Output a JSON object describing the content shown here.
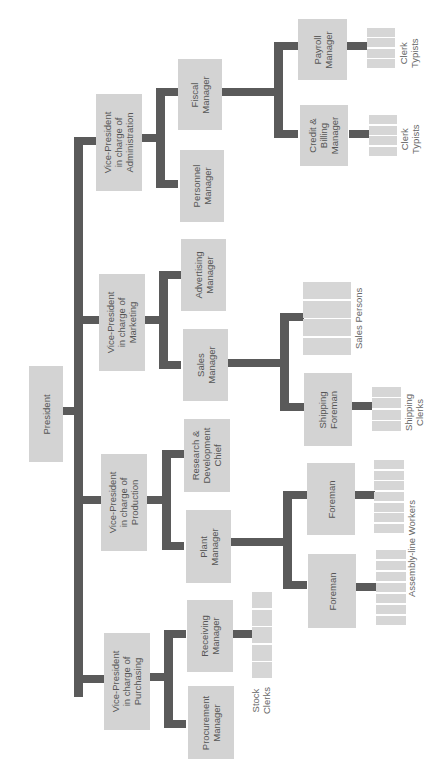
{
  "chart": {
    "orientation": "rotated 90 degrees clockwise (root on left)",
    "colors": {
      "box_fill": "#d3d3d3",
      "connector": "#5a5a5a",
      "text": "#555555",
      "background": "#ffffff"
    }
  },
  "nodes": {
    "president": "President",
    "vp_admin": "Vice-President\nin charge of\nAdministration",
    "vp_marketing": "Vice-President\nin charge of\nMarketing",
    "vp_production": "Vice-President\nin charge of\nProduction",
    "vp_purchasing": "Vice-President\nin charge of\nPurchasing",
    "fiscal_manager": "Fiscal\nManager",
    "personnel_manager": "Personnel\nManager",
    "advertising_manager": "Advertising\nManager",
    "sales_manager": "Sales\nManager",
    "rd_chief": "Research &\nDevelopment\nChief",
    "plant_manager": "Plant\nManager",
    "receiving_manager": "Receiving\nManager",
    "procurement_manager": "Procurement\nManager",
    "payroll_manager": "Payroll\nManager",
    "credit_billing_manager": "Credit &\nBilling\nManager",
    "shipping_foreman": "Shipping\nForeman",
    "foreman_1": "Foreman",
    "foreman_2": "Foreman"
  },
  "groups": {
    "clerk_typists_payroll": "Clerk\nTypists",
    "clerk_typists_credit": "Clerk\nTypists",
    "sales_persons": "Sales Persons",
    "shipping_clerks": "Shipping\nClerks",
    "assembly_line_workers": "Assembly-line Workers",
    "stock_clerks": "Stock\nClerks"
  },
  "hierarchy": [
    {
      "name": "President",
      "children": [
        {
          "name": "Vice-President in charge of Administration",
          "children": [
            {
              "name": "Fiscal Manager",
              "children": [
                {
                  "name": "Payroll Manager",
                  "children": [
                    {
                      "name": "Clerk Typists"
                    }
                  ]
                },
                {
                  "name": "Credit & Billing Manager",
                  "children": [
                    {
                      "name": "Clerk Typists"
                    }
                  ]
                }
              ]
            },
            {
              "name": "Personnel Manager"
            }
          ]
        },
        {
          "name": "Vice-President in charge of Marketing",
          "children": [
            {
              "name": "Advertising Manager"
            },
            {
              "name": "Sales Manager",
              "children": [
                {
                  "name": "Sales Persons"
                },
                {
                  "name": "Shipping Foreman",
                  "children": [
                    {
                      "name": "Shipping Clerks"
                    }
                  ]
                }
              ]
            }
          ]
        },
        {
          "name": "Vice-President in charge of Production",
          "children": [
            {
              "name": "Research & Development Chief"
            },
            {
              "name": "Plant Manager",
              "children": [
                {
                  "name": "Foreman",
                  "children": [
                    {
                      "name": "Assembly-line Workers"
                    }
                  ]
                },
                {
                  "name": "Foreman",
                  "children": [
                    {
                      "name": "Assembly-line Workers"
                    }
                  ]
                }
              ]
            }
          ]
        },
        {
          "name": "Vice-President in charge of Purchasing",
          "children": [
            {
              "name": "Receiving Manager",
              "children": [
                {
                  "name": "Stock Clerks"
                }
              ]
            },
            {
              "name": "Procurement Manager"
            }
          ]
        }
      ]
    }
  ]
}
